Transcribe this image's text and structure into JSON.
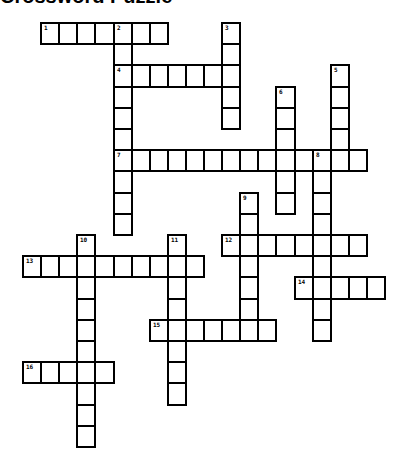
{
  "title": "Crossword Puzzle",
  "grid": {
    "origin_x": 22,
    "origin_y": 22,
    "cell_w": 18.1,
    "cell_h": 21.2,
    "border_color": "#000000",
    "cell_color": "#ffffff"
  },
  "entries": [
    {
      "number": "1",
      "direction": "across",
      "col": 1,
      "row": 0,
      "length": 7
    },
    {
      "number": "2",
      "direction": "down",
      "col": 5,
      "row": 0,
      "length": 10
    },
    {
      "number": "3",
      "direction": "down",
      "col": 11,
      "row": 0,
      "length": 5
    },
    {
      "number": "4",
      "direction": "across",
      "col": 5,
      "row": 2,
      "length": 7
    },
    {
      "number": "5",
      "direction": "down",
      "col": 17,
      "row": 2,
      "length": 5
    },
    {
      "number": "6",
      "direction": "down",
      "col": 14,
      "row": 3,
      "length": 6
    },
    {
      "number": "7",
      "direction": "across",
      "col": 5,
      "row": 6,
      "length": 14
    },
    {
      "number": "8",
      "direction": "down",
      "col": 16,
      "row": 6,
      "length": 9
    },
    {
      "number": "9",
      "direction": "down",
      "col": 12,
      "row": 8,
      "length": 7
    },
    {
      "number": "10",
      "direction": "down",
      "col": 3,
      "row": 10,
      "length": 10
    },
    {
      "number": "11",
      "direction": "down",
      "col": 8,
      "row": 10,
      "length": 8
    },
    {
      "number": "12",
      "direction": "across",
      "col": 11,
      "row": 10,
      "length": 8
    },
    {
      "number": "13",
      "direction": "across",
      "col": 0,
      "row": 11,
      "length": 10
    },
    {
      "number": "14",
      "direction": "across",
      "col": 15,
      "row": 12,
      "length": 5
    },
    {
      "number": "15",
      "direction": "across",
      "col": 7,
      "row": 14,
      "length": 7
    },
    {
      "number": "16",
      "direction": "across",
      "col": 0,
      "row": 16,
      "length": 5
    }
  ]
}
